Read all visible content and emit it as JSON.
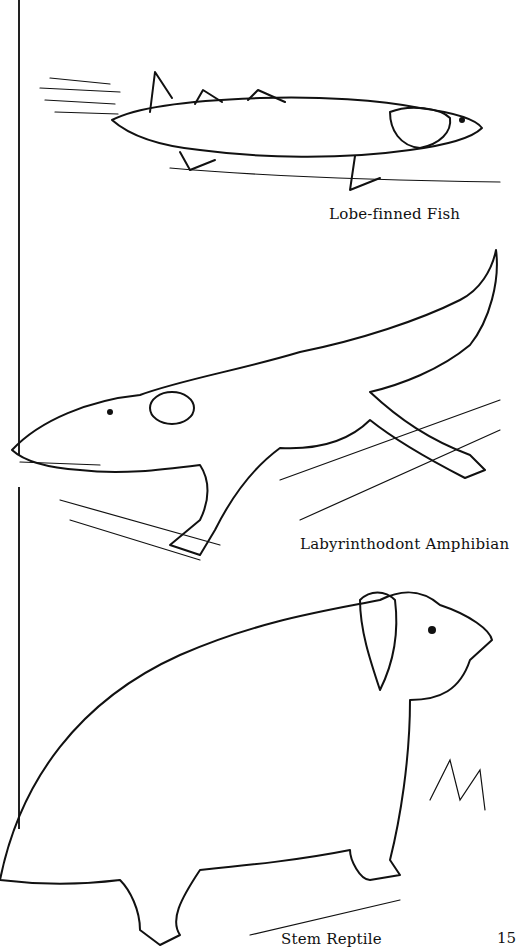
{
  "page": {
    "page_number": "15",
    "illustrations": [
      {
        "id": "fish",
        "caption": "Lobe-finned Fish"
      },
      {
        "id": "amphibian",
        "caption": "Labyrinthodont Amphibian"
      },
      {
        "id": "reptile",
        "caption": "Stem Reptile"
      }
    ]
  }
}
